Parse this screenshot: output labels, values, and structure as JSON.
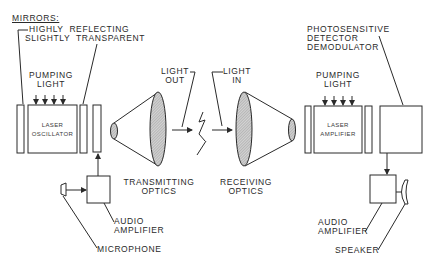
{
  "diagram": {
    "colors": {
      "ink": "#2a2a2a",
      "background": "#ffffff",
      "lens_hatch": "#bdbdbd"
    },
    "transmitter": {
      "mirrors_heading": "MIRRORS:",
      "mirror_highly_reflecting": "HIGHLY  REFLECTING",
      "mirror_slightly_transparent": "SLIGHTLY  TRANSPARENT",
      "pumping_light_1": "PUMPING",
      "pumping_light_2": "LIGHT",
      "laser_1": "LASER",
      "laser_2": "OSCILLATOR",
      "optics_1": "TRANSMITTING",
      "optics_2": "OPTICS",
      "audio_1": "AUDIO",
      "audio_2": "AMPLIFIER",
      "microphone": "MICROPHONE"
    },
    "link": {
      "light_out_1": "LIGHT",
      "light_out_2": "OUT",
      "light_in_1": "LIGHT",
      "light_in_2": "IN"
    },
    "receiver": {
      "detector_1": "PHOTOSENSITIVE",
      "detector_2": "DETECTOR",
      "detector_3": "DEMODULATOR",
      "pumping_light_1": "PUMPING",
      "pumping_light_2": "LIGHT",
      "laser_1": "LASER",
      "laser_2": "AMPLIFIER",
      "optics_1": "RECEIVING",
      "optics_2": "OPTICS",
      "audio_1": "AUDIO",
      "audio_2": "AMPLIFIER",
      "speaker": "SPEAKER"
    }
  }
}
